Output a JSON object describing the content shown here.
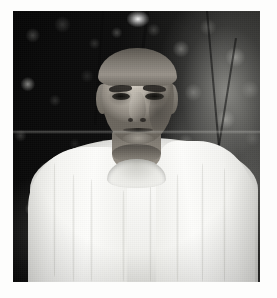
{
  "page": {
    "background_color": "#fdfdfc",
    "width": 277,
    "height": 298,
    "caption": ""
  },
  "photograph": {
    "name": "portrait-photograph",
    "alt_text": "Black and white portrait photograph of an elderly South Asian man wearing a white shawl over a white kurta, standing outdoors in front of dark foliage",
    "medium": "black-and-white photograph",
    "orientation": "portrait",
    "frame": {
      "left": 13,
      "top": 11,
      "width": 247,
      "height": 271
    },
    "colors": {
      "background_dark": "#0b0b0b",
      "foliage_mid": "#3a3a37",
      "highlight": "#ffffff",
      "garment_white": "#fbfbf9",
      "skin_mid": "#b3ada3",
      "hair_grey": "#98928a",
      "margin": "#ffffff"
    },
    "subject": {
      "description": "elderly man, bust-length frontal portrait",
      "hair": "receding, swept-back greying hair",
      "expression": "calm, neutral, looking toward camera",
      "garment": "white draped shawl over round-neck kurta"
    },
    "background": {
      "description": "out-of-focus dark foliage with bright dappled highlights, brighter toward the right"
    },
    "artifacts": {
      "scan_line": "faint horizontal lighter band across the upper-middle of the image",
      "grain": "visible photographic grain / halftone texture"
    }
  }
}
